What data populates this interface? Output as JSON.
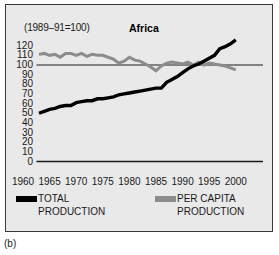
{
  "figure": {
    "caption": "(b)",
    "panel_background": "#e9e9e9",
    "border_color": "#3a3a3a"
  },
  "header": {
    "base_note": "(1989–91=100)",
    "title": "Africa"
  },
  "legend": {
    "position": "below-axis",
    "entries": [
      {
        "label_line1": "TOTAL",
        "label_line2": "PRODUCTION",
        "color": "#000000",
        "name": "total-production"
      },
      {
        "label_line1": "PER CAPITA",
        "label_line2": "PRODUCTION",
        "color": "#8c8c8c",
        "name": "per-capita-production"
      }
    ]
  },
  "chart_data": {
    "type": "line",
    "title": "Africa",
    "subtitle": "(1989–91=100)",
    "xlabel": "",
    "ylabel": "",
    "xlim": [
      1960,
      2001
    ],
    "ylim": [
      0,
      125
    ],
    "yticks": [
      0,
      10,
      20,
      30,
      40,
      50,
      60,
      70,
      80,
      90,
      100,
      110,
      120
    ],
    "xticks": [
      1960,
      1965,
      1970,
      1975,
      1980,
      1985,
      1990,
      1995,
      2000
    ],
    "grid": false,
    "reference_line": {
      "value": 100,
      "color": "#1a1a1a"
    },
    "legend_position": "bottom",
    "x": [
      1963,
      1964,
      1965,
      1966,
      1967,
      1968,
      1969,
      1970,
      1971,
      1972,
      1973,
      1974,
      1975,
      1976,
      1977,
      1978,
      1979,
      1980,
      1981,
      1982,
      1983,
      1984,
      1985,
      1986,
      1987,
      1988,
      1989,
      1990,
      1991,
      1992,
      1993,
      1994,
      1995,
      1996,
      1997,
      1998,
      1999,
      2000
    ],
    "series": [
      {
        "name": "TOTAL PRODUCTION",
        "color": "#000000",
        "values": [
          50,
          52,
          54,
          55,
          57,
          58,
          58,
          61,
          62,
          63,
          63,
          65,
          65,
          66,
          67,
          69,
          70,
          71,
          72,
          73,
          74,
          75,
          76,
          76,
          82,
          85,
          88,
          92,
          96,
          99,
          101,
          104,
          107,
          110,
          117,
          119,
          122,
          126
        ]
      },
      {
        "name": "PER CAPITA PRODUCTION",
        "color": "#8c8c8c",
        "values": [
          111,
          112,
          110,
          111,
          108,
          112,
          112,
          110,
          112,
          109,
          111,
          110,
          110,
          108,
          106,
          102,
          104,
          108,
          105,
          104,
          101,
          98,
          94,
          99,
          102,
          103,
          102,
          101,
          103,
          100,
          103,
          100,
          102,
          101,
          100,
          99,
          97,
          95
        ]
      }
    ]
  }
}
